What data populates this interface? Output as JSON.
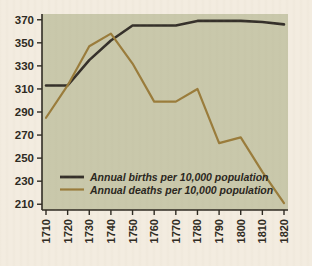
{
  "figure": {
    "background_color": "#f3ece0",
    "plot_background_color": "#c9c8ab",
    "plot_border_color": "#2e2a22"
  },
  "chart_data": {
    "type": "line",
    "title": "",
    "subtitle": "",
    "xlabel": "",
    "ylabel": "",
    "xlim": [
      1710,
      1820
    ],
    "ylim": [
      205,
      375
    ],
    "grid": false,
    "legend_position": "inside-bottom-left",
    "x": [
      1710,
      1720,
      1730,
      1740,
      1750,
      1760,
      1770,
      1780,
      1790,
      1800,
      1810,
      1820
    ],
    "xtick_labels": [
      "1710",
      "1720",
      "1730",
      "1740",
      "1750",
      "1760",
      "1770",
      "1780",
      "1790",
      "1800",
      "1810",
      "1820"
    ],
    "ytick_values": [
      210,
      230,
      250,
      270,
      290,
      310,
      330,
      350,
      370
    ],
    "ytick_labels": [
      "210",
      "230",
      "250",
      "270",
      "290",
      "310",
      "330",
      "350",
      "370"
    ],
    "series": [
      {
        "name": "Annual births per 10,000 population",
        "color": "#35302a",
        "values": [
          313,
          313,
          335,
          352,
          365,
          365,
          365,
          369,
          369,
          369,
          368,
          366
        ]
      },
      {
        "name": "Annual deaths per 10,000 population",
        "color": "#9a7c3b",
        "values": [
          285,
          313,
          347,
          358,
          332,
          299,
          299,
          310,
          263,
          268,
          238,
          211
        ]
      }
    ],
    "annotations": []
  },
  "legend": {
    "entries": [
      {
        "label": "Annual births per 10,000 population",
        "color": "#35302a"
      },
      {
        "label": "Annual deaths per 10,000 population",
        "color": "#9a7c3b"
      }
    ]
  }
}
